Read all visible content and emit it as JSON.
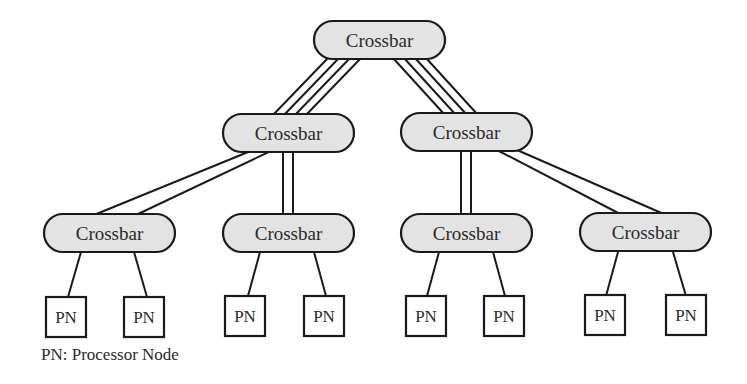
{
  "diagram": {
    "type": "hierarchical crossbar network",
    "levels": 3,
    "nodes": {
      "root": {
        "label": "Crossbar"
      },
      "mid_left": {
        "label": "Crossbar"
      },
      "mid_right": {
        "label": "Crossbar"
      },
      "leaf_1": {
        "label": "Crossbar"
      },
      "leaf_2": {
        "label": "Crossbar"
      },
      "leaf_3": {
        "label": "Crossbar"
      },
      "leaf_4": {
        "label": "Crossbar"
      }
    },
    "processor_nodes": [
      {
        "label": "PN"
      },
      {
        "label": "PN"
      },
      {
        "label": "PN"
      },
      {
        "label": "PN"
      },
      {
        "label": "PN"
      },
      {
        "label": "PN"
      },
      {
        "label": "PN"
      },
      {
        "label": "PN"
      }
    ],
    "link_widths": {
      "root_to_mid": 4,
      "mid_to_leaf": 2,
      "leaf_to_pn": 1
    },
    "colors": {
      "crossbar_fill": "#e3e3e3",
      "stroke": "#1a1a1a",
      "pn_fill": "#ffffff"
    }
  },
  "legend": {
    "text": "PN: Processor Node"
  }
}
